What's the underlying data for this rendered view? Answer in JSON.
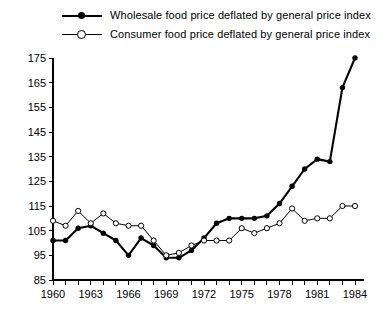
{
  "legend": {
    "position": "top",
    "entries": [
      {
        "label": "Wholesale food price deflated by general price index",
        "marker": "filled-circle-icon",
        "style": "thick-solid"
      },
      {
        "label": "Consumer food price deflated by general price index",
        "marker": "open-circle-icon",
        "style": "thin-solid"
      }
    ]
  },
  "chart_data": {
    "type": "line",
    "title": "",
    "subtitle": "",
    "xlabel": "",
    "ylabel": "",
    "x": [
      1960,
      1961,
      1962,
      1963,
      1964,
      1965,
      1966,
      1967,
      1968,
      1969,
      1970,
      1971,
      1972,
      1973,
      1974,
      1975,
      1976,
      1977,
      1978,
      1979,
      1980,
      1981,
      1982,
      1983,
      1984
    ],
    "xlim": [
      1960,
      1984
    ],
    "ylim": [
      85,
      175
    ],
    "xticks": [
      1960,
      1961,
      1962,
      1963,
      1964,
      1965,
      1966,
      1967,
      1968,
      1969,
      1970,
      1971,
      1972,
      1973,
      1974,
      1975,
      1976,
      1977,
      1978,
      1979,
      1980,
      1981,
      1982,
      1983,
      1984
    ],
    "xticklabels": [
      "1960",
      "",
      "",
      "1963",
      "",
      "",
      "1966",
      "",
      "",
      "1969",
      "",
      "",
      "1972",
      "",
      "",
      "1975",
      "",
      "",
      "1978",
      "",
      "",
      "1981",
      "",
      "",
      "1984"
    ],
    "yticks": [
      85,
      95,
      105,
      115,
      125,
      135,
      145,
      155,
      165,
      175
    ],
    "yticklabels": [
      "85",
      "95",
      "105",
      "115",
      "125",
      "135",
      "145",
      "155",
      "165",
      "175"
    ],
    "grid": false,
    "legend_position": "top",
    "series": [
      {
        "name": "Wholesale food price deflated by general price index",
        "marker": "filled-circle",
        "values": [
          101,
          101,
          106,
          107,
          104,
          101,
          95,
          102,
          99,
          94,
          94,
          97,
          102,
          108,
          110,
          110,
          110,
          111,
          116,
          123,
          130,
          134,
          133,
          163,
          175
        ]
      },
      {
        "name": "Consumer food price deflated by general price index",
        "marker": "open-circle",
        "values": [
          109,
          107,
          113,
          108,
          112,
          108,
          107,
          107,
          101,
          95,
          96,
          99,
          101,
          101,
          101,
          106,
          104,
          106,
          108,
          114,
          109,
          110,
          110,
          115,
          115
        ]
      }
    ]
  }
}
